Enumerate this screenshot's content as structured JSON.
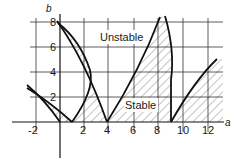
{
  "diagram": {
    "type": "stability-chart",
    "axes": {
      "x_label": "a",
      "y_label": "b",
      "x_ticks": [
        "-2",
        "2",
        "4",
        "6",
        "8",
        "10",
        "12"
      ],
      "y_ticks": [
        "2",
        "4",
        "6",
        "8"
      ]
    },
    "regions": {
      "unstable_label": "Unstable",
      "stable_label": "Stable"
    }
  }
}
